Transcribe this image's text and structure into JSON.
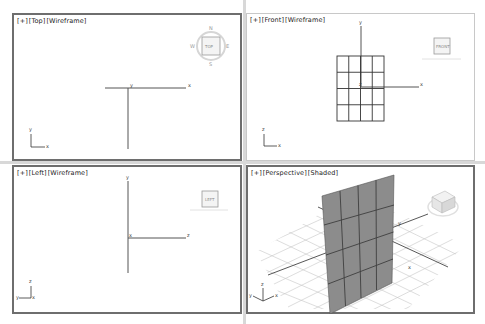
{
  "viewports": [
    {
      "id": "top",
      "menu": "[+]",
      "view": "[Top]",
      "shading": "[Wireframe]",
      "active": true,
      "viewcube": {
        "face": "TOP",
        "compass": {
          "north": "N",
          "south": "S",
          "east": "E",
          "west": "W"
        }
      },
      "axes": {
        "horizontal": "x",
        "vertical": "y",
        "origin_label": "y"
      },
      "tripod": {
        "up": "y",
        "right": "x",
        "origin": "z"
      }
    },
    {
      "id": "front",
      "menu": "[+]",
      "view": "[Front]",
      "shading": "[Wireframe]",
      "active": false,
      "viewcube": {
        "face": "FRONT"
      },
      "axes": {
        "horizontal": "x",
        "vertical": "y",
        "origin_label": "z"
      },
      "tripod": {
        "up": "z",
        "right": "x",
        "origin": ""
      },
      "grid": {
        "columns": 4,
        "rows": 4
      }
    },
    {
      "id": "left",
      "menu": "[+]",
      "view": "[Left]",
      "shading": "[Wireframe]",
      "active": true,
      "viewcube": {
        "face": "LEFT"
      },
      "axes": {
        "horizontal": "z",
        "vertical": "y",
        "origin_label": "x"
      },
      "tripod": {
        "up": "z",
        "right": "x",
        "left": "y"
      }
    },
    {
      "id": "perspective",
      "menu": "[+]",
      "view": "[Perspective]",
      "shading": "[Shaded]",
      "active": true,
      "axes": {
        "x_label": "x",
        "y_label": "y"
      },
      "tripod": {
        "up": "z",
        "right": "x",
        "left": "y"
      },
      "plane": {
        "color": "#8c8c8c",
        "columns": 4,
        "rows": 4
      }
    }
  ],
  "colors": {
    "active_border": "#6e6e6e",
    "axis_line": "#555555",
    "grid_line": "#c4c4c4",
    "plane": "#8c8c8c"
  }
}
